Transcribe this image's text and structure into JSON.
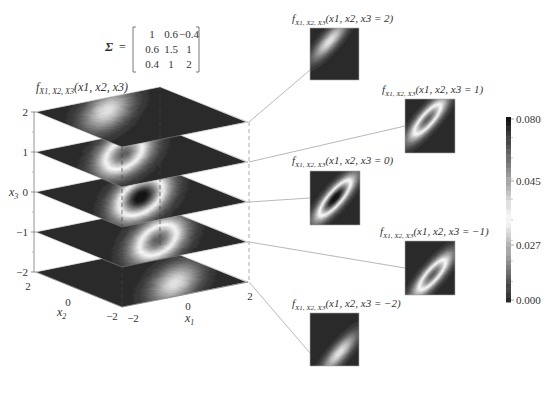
{
  "chart_data": {
    "type": "heatmap",
    "sigma": {
      "label": "Σ =",
      "rows": [
        [
          "1",
          "0.6",
          "−0.4"
        ],
        [
          "0.6",
          "1.5",
          "1"
        ],
        [
          "0.4",
          "1",
          "2"
        ]
      ]
    },
    "matrix_values": [
      [
        1,
        0.6,
        -0.4
      ],
      [
        0.6,
        1.5,
        1
      ],
      [
        -0.4,
        1,
        2
      ]
    ],
    "main_label": "f_{X1,X2,X3}(x1, x2, x3)",
    "axes": {
      "x1": {
        "label": "x1",
        "range": [
          -2,
          2
        ],
        "ticks": [
          "−2",
          "0",
          "2"
        ]
      },
      "x2": {
        "label": "x2",
        "range": [
          -2,
          2
        ],
        "ticks": [
          "−2",
          "0",
          "2"
        ]
      },
      "x3": {
        "label": "x3",
        "range": [
          -2,
          2
        ],
        "ticks": [
          "2",
          "1",
          "0",
          "−1",
          "−2"
        ]
      }
    },
    "slices": [
      {
        "x3": 2,
        "title_fn": "f",
        "title_sub": "X1, X2, X3",
        "title_args": "(x1, x2, x3 = 2)"
      },
      {
        "x3": 1,
        "title_fn": "f",
        "title_sub": "X1, X2, X3",
        "title_args": "(x1, x2, x3 = 1)"
      },
      {
        "x3": 0,
        "title_fn": "f",
        "title_sub": "X1, X2, X3",
        "title_args": "(x1, x2, x3 = 0)"
      },
      {
        "x3": -1,
        "title_fn": "f",
        "title_sub": "X1, X2, X3",
        "title_args": "(x1, x2, x3 = −1)"
      },
      {
        "x3": -2,
        "title_fn": "f",
        "title_sub": "X1, X2, X3",
        "title_args": "(x1, x2, x3 = −2)"
      }
    ],
    "colorbar": {
      "ticks": [
        "0.080",
        "0.045",
        "0.027",
        "0.000"
      ],
      "tick_values": [
        0.08,
        0.045,
        0.027,
        0.0
      ],
      "colormap": "dark-high-light-mid-dark-low"
    },
    "grid": false
  },
  "labels": {
    "main_fn": "f",
    "main_sub": "X1, X2, X3",
    "main_args": "(x1, x2, x3)",
    "x3_axis": "x",
    "x3_sub": "3",
    "x2_axis": "x",
    "x2_sub": "2",
    "x1_axis": "x",
    "x1_sub": "1",
    "sigma_symbol": "Σ",
    "sigma_eq": "="
  }
}
